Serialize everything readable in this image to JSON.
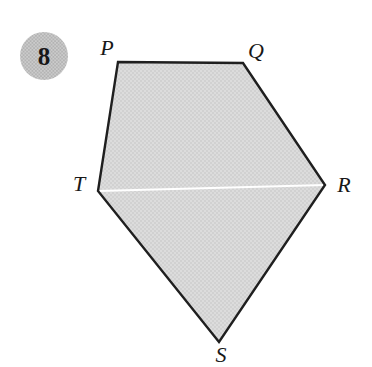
{
  "problem_badge": {
    "number": "8"
  },
  "figure": {
    "type": "pentagon",
    "vertices": [
      {
        "label": "P",
        "x": 118,
        "y": 62,
        "lx": 107,
        "ly": 55
      },
      {
        "label": "Q",
        "x": 243,
        "y": 63,
        "lx": 256,
        "ly": 58
      },
      {
        "label": "R",
        "x": 325,
        "y": 185,
        "lx": 344,
        "ly": 192
      },
      {
        "label": "S",
        "x": 219,
        "y": 342,
        "lx": 221,
        "ly": 362
      },
      {
        "label": "T",
        "x": 98,
        "y": 191,
        "lx": 79,
        "ly": 191
      }
    ],
    "divider": {
      "from": "T",
      "to": "R",
      "color": "#ffffff"
    }
  },
  "colors": {
    "background": "#ffffff",
    "outline": "#1f1f1f",
    "fill_base": "#dcdcdc",
    "fill_dot": "#c3c3c3",
    "badge_base": "#cbcbcb",
    "badge_dot": "#a9a9a9",
    "label_color": "#181818"
  }
}
